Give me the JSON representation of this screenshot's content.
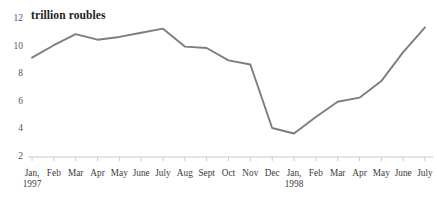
{
  "chart_data": {
    "type": "line",
    "title": "trillion roubles",
    "xlabel": "",
    "ylabel": "",
    "ylim": [
      2,
      12
    ],
    "yticks": [
      12,
      10,
      8,
      6,
      4,
      2
    ],
    "grid": false,
    "legend": null,
    "line_color": "#7d7d7d",
    "axis_color": "#c9c9c9",
    "categories": [
      "Jan,\n1997",
      "Feb",
      "Mar",
      "Apr",
      "May",
      "June",
      "July",
      "Aug",
      "Sept",
      "Oct",
      "Nov",
      "Dec",
      "Jan,\n1998",
      "Feb",
      "Mar",
      "Apr",
      "May",
      "June",
      "July"
    ],
    "x_tick_labels": [
      {
        "month": "Jan,",
        "year": "1997"
      },
      {
        "month": "Feb",
        "year": ""
      },
      {
        "month": "Mar",
        "year": ""
      },
      {
        "month": "Apr",
        "year": ""
      },
      {
        "month": "May",
        "year": ""
      },
      {
        "month": "June",
        "year": ""
      },
      {
        "month": "July",
        "year": ""
      },
      {
        "month": "Aug",
        "year": ""
      },
      {
        "month": "Sept",
        "year": ""
      },
      {
        "month": "Oct",
        "year": ""
      },
      {
        "month": "Nov",
        "year": ""
      },
      {
        "month": "Dec",
        "year": ""
      },
      {
        "month": "Jan,",
        "year": "1998"
      },
      {
        "month": "Feb",
        "year": ""
      },
      {
        "month": "Mar",
        "year": ""
      },
      {
        "month": "Apr",
        "year": ""
      },
      {
        "month": "May",
        "year": ""
      },
      {
        "month": "June",
        "year": ""
      },
      {
        "month": "July",
        "year": ""
      }
    ],
    "values": [
      9.2,
      10.1,
      10.9,
      10.5,
      10.7,
      11.0,
      11.3,
      10.0,
      9.9,
      9.0,
      8.7,
      4.1,
      3.7,
      4.9,
      6.0,
      6.3,
      7.5,
      9.6,
      11.4
    ]
  }
}
